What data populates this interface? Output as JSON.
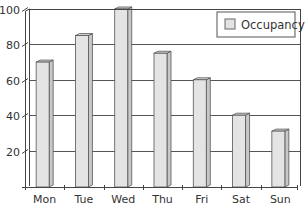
{
  "chart_data": {
    "type": "bar",
    "title": "",
    "xlabel": "",
    "ylabel": "",
    "categories": [
      "Mon",
      "Tue",
      "Wed",
      "Thu",
      "Fri",
      "Sat",
      "Sun"
    ],
    "series": [
      {
        "name": "Occupancy",
        "values": [
          70,
          85,
          100,
          75,
          60,
          40,
          31
        ]
      }
    ],
    "ylim": [
      0,
      100
    ],
    "yticks": [
      20,
      40,
      60,
      80,
      100
    ],
    "ytick_labels": [
      "20",
      "40",
      "60",
      "80",
      "100"
    ],
    "grid": true,
    "legend": {
      "position": "top-right",
      "entries": [
        "Occupancy"
      ]
    },
    "style": {
      "bar_fill": "#e4e4e4",
      "bar_side": "#c8c8c8",
      "bar_top": "#d6d6d6",
      "bar_stroke": "#555555",
      "grid_color": "#555555",
      "axis_color": "#444444"
    }
  }
}
